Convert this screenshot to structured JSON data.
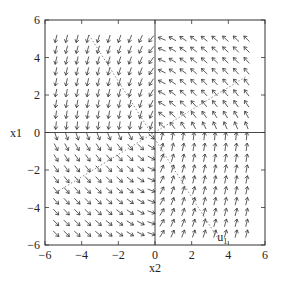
{
  "chart_data": {
    "type": "quiver",
    "title": "",
    "xlabel": "x2",
    "ylabel": "x1",
    "xlim": [
      -6,
      6
    ],
    "ylim": [
      -6,
      6
    ],
    "xticks": [
      -6,
      -4,
      -2,
      0,
      2,
      4,
      6
    ],
    "yticks": [
      -6,
      -4,
      -2,
      0,
      2,
      4,
      6
    ],
    "xtick_labels": [
      "−6",
      "−4",
      "−2",
      "0",
      "2",
      "4",
      "6"
    ],
    "ytick_labels": [
      "−6",
      "−4",
      "−2",
      "0",
      "2",
      "4",
      "6"
    ],
    "grid": false,
    "zero_lines": true,
    "annotation": {
      "text": "u",
      "subscript": "1",
      "x": 3.4,
      "y": -5.8
    },
    "vector_grid": {
      "x_start": -5.4,
      "x_end": 5.0,
      "y_start": -5.4,
      "y_end": 5.0,
      "n": 19
    },
    "field_description": "Upper-left quadrant arrows point down; upper-right point left/down-left; lower-left point right; lower-right point up. Dotted separatrix lines through origin (slopes approx ±0.7 and ±2).",
    "separatrices": [
      {
        "points": [
          [
            -5.4,
            -3.2
          ],
          [
            5.0,
            3.0
          ]
        ]
      },
      {
        "points": [
          [
            -3.6,
            5.2
          ],
          [
            3.4,
            -5.6
          ]
        ]
      }
    ],
    "colors": {
      "arrow": "#333333",
      "frame": "#333333",
      "dotted": "#555555"
    }
  }
}
